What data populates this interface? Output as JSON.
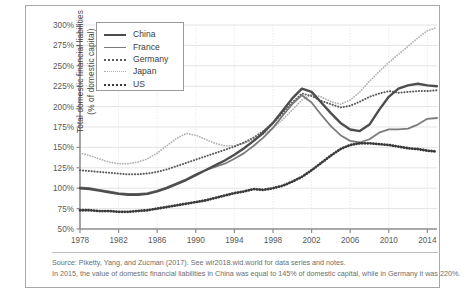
{
  "chart_data": {
    "type": "line",
    "title": "",
    "xlabel": "",
    "ylabel": "Total domestic financial liabilities\n(% of domestic capital)",
    "ylabel_line1": "Total domestic financial liabilities",
    "ylabel_line2": "(% of domestic capital)",
    "xlim": [
      1978,
      2015
    ],
    "ylim": [
      50,
      300
    ],
    "yticks": [
      "50%",
      "75%",
      "100%",
      "125%",
      "150%",
      "175%",
      "200%",
      "225%",
      "250%",
      "275%",
      "300%"
    ],
    "ytick_values": [
      50,
      75,
      100,
      125,
      150,
      175,
      200,
      225,
      250,
      275,
      300
    ],
    "xticks": [
      "1978",
      "1982",
      "1986",
      "1990",
      "1994",
      "1998",
      "2002",
      "2006",
      "2010",
      "2014"
    ],
    "xtick_values": [
      1978,
      1982,
      1986,
      1990,
      1994,
      1998,
      2002,
      2006,
      2010,
      2014
    ],
    "grid": true,
    "legend_position": "top-left",
    "x": [
      1978,
      1979,
      1980,
      1981,
      1982,
      1983,
      1984,
      1985,
      1986,
      1987,
      1988,
      1989,
      1990,
      1991,
      1992,
      1993,
      1994,
      1995,
      1996,
      1997,
      1998,
      1999,
      2000,
      2001,
      2002,
      2003,
      2004,
      2005,
      2006,
      2007,
      2008,
      2009,
      2010,
      2011,
      2012,
      2013,
      2014,
      2015
    ],
    "series": [
      {
        "name": "China",
        "color": "#4d4d4d",
        "style": "solid-thick",
        "values": [
          100,
          99,
          97,
          95,
          93,
          92,
          92,
          93,
          96,
          100,
          105,
          110,
          116,
          122,
          128,
          134,
          141,
          149,
          158,
          168,
          180,
          195,
          210,
          222,
          218,
          205,
          192,
          180,
          172,
          170,
          178,
          196,
          212,
          222,
          226,
          228,
          226,
          225
        ]
      },
      {
        "name": "France",
        "color": "#7b7b7b",
        "style": "solid",
        "values": [
          101,
          100,
          98,
          96,
          94,
          93,
          93,
          94,
          97,
          101,
          106,
          111,
          117,
          122,
          126,
          130,
          136,
          143,
          152,
          162,
          174,
          189,
          203,
          214,
          205,
          190,
          176,
          165,
          158,
          156,
          160,
          168,
          172,
          172,
          173,
          178,
          185,
          186
        ]
      },
      {
        "name": "Germany",
        "color": "#5a5a5a",
        "style": "dotted",
        "values": [
          122,
          121,
          120,
          119,
          118,
          117,
          117,
          118,
          120,
          123,
          127,
          131,
          135,
          139,
          143,
          147,
          151,
          156,
          162,
          170,
          180,
          192,
          205,
          216,
          213,
          207,
          203,
          199,
          201,
          206,
          212,
          216,
          219,
          217,
          218,
          219,
          219,
          220
        ]
      },
      {
        "name": "Japan",
        "color": "#b0b0b0",
        "style": "dotted-light",
        "values": [
          143,
          140,
          136,
          132,
          130,
          130,
          132,
          136,
          143,
          152,
          161,
          167,
          165,
          160,
          155,
          152,
          152,
          155,
          160,
          166,
          174,
          184,
          196,
          208,
          215,
          212,
          206,
          203,
          208,
          218,
          231,
          243,
          254,
          264,
          274,
          284,
          293,
          297
        ]
      },
      {
        "name": "US",
        "color": "#3a3a3a",
        "style": "dotted-thick",
        "values": [
          73,
          73,
          72,
          72,
          71,
          71,
          72,
          73,
          75,
          77,
          79,
          81,
          83,
          85,
          88,
          91,
          94,
          96,
          99,
          98,
          100,
          103,
          108,
          114,
          122,
          131,
          140,
          148,
          153,
          155,
          155,
          154,
          153,
          151,
          149,
          148,
          146,
          145
        ]
      }
    ],
    "annotations": []
  },
  "legend": {
    "items": [
      {
        "label": "China",
        "key": "china"
      },
      {
        "label": "France",
        "key": "france"
      },
      {
        "label": "Germany",
        "key": "germany"
      },
      {
        "label": "Japan",
        "key": "japan"
      },
      {
        "label": "US",
        "key": "us"
      }
    ]
  },
  "notes": {
    "line1": "Source: Piketty, Yang, and Zucman (2017). See wir2018.wid.world for data series and notes.",
    "line2": "In 2015, the value of domestic financial liabilities in China was equal to 145% of domestic capital, while in Germany it was 220%."
  }
}
